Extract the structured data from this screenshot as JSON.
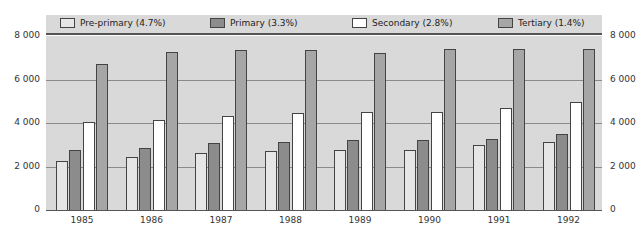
{
  "chart_data": {
    "type": "bar",
    "title": "",
    "xlabel": "",
    "ylabel": "",
    "ylim": [
      0,
      8000
    ],
    "yticks": [
      "0",
      "2 000",
      "4 000",
      "6 000",
      "8 000"
    ],
    "y_axis_both_sides": true,
    "grid": true,
    "legend_position": "top",
    "categories": [
      "1985",
      "1986",
      "1987",
      "1988",
      "1989",
      "1990",
      "1991",
      "1992"
    ],
    "series": [
      {
        "name": "Pre-primary (4.7%)",
        "color": "#e6e6e6",
        "values": [
          2250,
          2450,
          2600,
          2700,
          2750,
          2750,
          3000,
          3150
        ]
      },
      {
        "name": "Primary (3.3%)",
        "color": "#8c8c8c",
        "values": [
          2750,
          2850,
          3100,
          3150,
          3200,
          3200,
          3250,
          3500
        ]
      },
      {
        "name": "Secondary (2.8%)",
        "color": "#ffffff",
        "values": [
          4050,
          4150,
          4300,
          4450,
          4500,
          4500,
          4700,
          4950
        ]
      },
      {
        "name": "Tertiary (1.4%)",
        "color": "#a6a6a6",
        "values": [
          6700,
          7250,
          7350,
          7350,
          7200,
          7400,
          7400,
          7400
        ]
      }
    ]
  },
  "legend": {
    "items": [
      {
        "label": "Pre-primary (4.7%)",
        "color": "#e6e6e6"
      },
      {
        "label": "Primary (3.3%)",
        "color": "#8c8c8c"
      },
      {
        "label": "Secondary (2.8%)",
        "color": "#ffffff"
      },
      {
        "label": "Tertiary (1.4%)",
        "color": "#a6a6a6"
      }
    ]
  },
  "colors": {
    "plot_bg": "#d9d9d9",
    "gridline": "#8a8a8a"
  }
}
